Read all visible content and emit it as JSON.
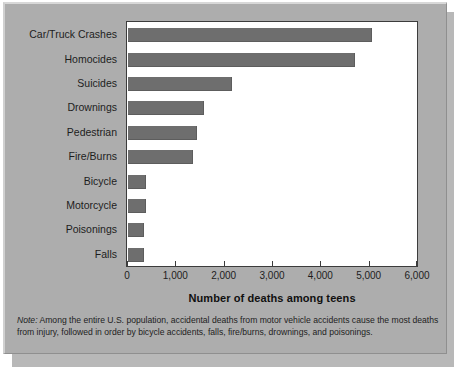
{
  "figure": {
    "background_color": "#adadad",
    "plot_background_color": "#ffffff",
    "bar_color": "#6e6e6e",
    "axis_color": "#3c3c3c",
    "note_label": "Note:",
    "note_text": " Among the entire U.S. population, accidental deaths from motor vehicle accidents cause the most deaths from injury, followed in order by bicycle accidents, falls, fire/burns, drownings, and poisonings."
  },
  "chart_data": {
    "type": "bar",
    "orientation": "horizontal",
    "title": "",
    "xlabel": "Number of deaths among teens",
    "ylabel": "",
    "xlim": [
      0,
      6000
    ],
    "xticks": [
      0,
      1000,
      2000,
      3000,
      4000,
      5000,
      6000
    ],
    "xticklabels": [
      "0",
      "1,000",
      "2,000",
      "3,000",
      "4,000",
      "5,000",
      "6,000"
    ],
    "grid": false,
    "legend": false,
    "categories": [
      "Car/Truck Crashes",
      "Homocides",
      "Suicides",
      "Drownings",
      "Pedestrian",
      "Fire/Burns",
      "Bicycle",
      "Motorcycle",
      "Poisonings",
      "Falls"
    ],
    "values": [
      5050,
      4700,
      2150,
      1580,
      1420,
      1340,
      370,
      370,
      340,
      330
    ]
  }
}
